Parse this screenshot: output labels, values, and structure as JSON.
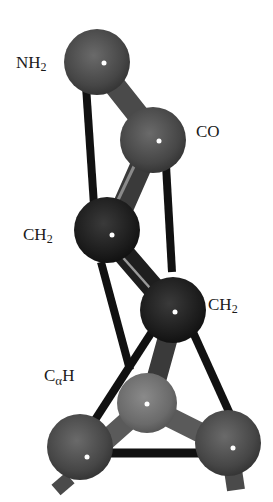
{
  "diagram": {
    "type": "molecular-ball-and-stick",
    "labels": {
      "nh2": {
        "base": "NH",
        "sub": "2"
      },
      "co": {
        "base": "CO"
      },
      "ch2_upper": {
        "base": "CH",
        "sub": "2"
      },
      "ch2_lower": {
        "base": "CH",
        "sub": "2"
      },
      "calpha_h": {
        "base": "C",
        "greek": "α",
        "tail": "H"
      }
    },
    "atoms": [
      {
        "id": "nh2",
        "cx": 97,
        "cy": 62,
        "r": 33,
        "color": "#4a4a4a"
      },
      {
        "id": "co",
        "cx": 153,
        "cy": 140,
        "r": 33,
        "color": "#4e4e4e"
      },
      {
        "id": "ch2_upper",
        "cx": 108,
        "cy": 230,
        "r": 33,
        "color": "#1e1e1e"
      },
      {
        "id": "ch2_lower",
        "cx": 173,
        "cy": 310,
        "r": 33,
        "color": "#1c1c1c"
      },
      {
        "id": "calpha_h",
        "cx": 147,
        "cy": 403,
        "r": 30,
        "color": "#6a6a6a"
      },
      {
        "id": "bottom_left",
        "cx": 87,
        "cy": 457,
        "r": 33,
        "color": "#454545"
      },
      {
        "id": "bottom_right",
        "cx": 233,
        "cy": 448,
        "r": 33,
        "color": "#454545"
      }
    ],
    "colors": {
      "bond_black": "#111111",
      "bond_gray": "#5a5a5a",
      "highlight": "#ffffff",
      "background": "#ffffff"
    }
  }
}
